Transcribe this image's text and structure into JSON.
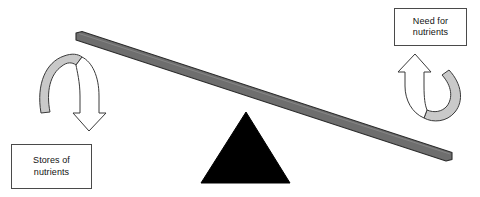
{
  "diagram": {
    "type": "seesaw-balance-diagram",
    "canvas": {
      "width": 480,
      "height": 197,
      "background": "#ffffff"
    },
    "labels": {
      "left": {
        "name": "stores-of-nutrients",
        "text": "Stores of\nnutrients",
        "line1": "Stores of",
        "line2": "nutrients",
        "border_color": "#4a4a4a",
        "fill_color": "#ffffff",
        "text_color": "#121212"
      },
      "right": {
        "name": "need-for-nutrients",
        "text": "Need for\nnutrients",
        "line1": "Need for",
        "line2": "nutrients",
        "border_color": "#4a4a4a",
        "fill_color": "#ffffff",
        "text_color": "#121212"
      }
    },
    "beam": {
      "name": "seesaw-beam",
      "fill_color": "#6e6e6e",
      "stroke_color": "#2b2b2b",
      "tilt": "left-end-up, right-end-down",
      "left_end": {
        "x": 76,
        "y": 36
      },
      "right_end": {
        "x": 452,
        "y": 158
      }
    },
    "fulcrum": {
      "name": "fulcrum-triangle",
      "fill_color": "#000000",
      "apex": {
        "x": 246,
        "y": 113
      },
      "base_left": {
        "x": 201,
        "y": 183
      },
      "base_right": {
        "x": 289,
        "y": 183
      }
    },
    "arrows": {
      "left": {
        "name": "arrow-curving-down",
        "direction": "down",
        "band_fill": "#c9c9c9",
        "outline_fill": "#ffffff",
        "stroke_color": "#3a3a3a",
        "meaning": "Stores of nutrients decreasing"
      },
      "right": {
        "name": "arrow-curving-up",
        "direction": "up",
        "band_fill": "#c9c9c9",
        "outline_fill": "#ffffff",
        "stroke_color": "#3a3a3a",
        "meaning": "Need for nutrients increasing"
      }
    }
  }
}
